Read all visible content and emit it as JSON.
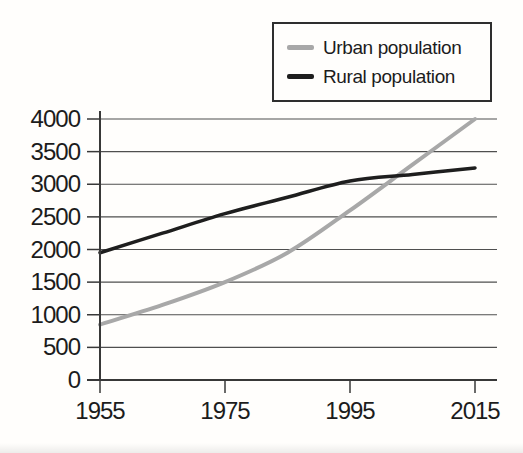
{
  "chart_data": {
    "type": "line",
    "title": "",
    "xlabel": "",
    "ylabel": "",
    "x": [
      1955,
      1965,
      1975,
      1985,
      1995,
      2005,
      2015
    ],
    "xlim": [
      1955,
      2015
    ],
    "x_ticks": [
      1955,
      1975,
      1995,
      2015
    ],
    "x_tick_labels": [
      "1955",
      "1975",
      "1995",
      "2015"
    ],
    "ylim": [
      0,
      4000
    ],
    "y_ticks": [
      0,
      500,
      1000,
      1500,
      2000,
      2500,
      3000,
      3500,
      4000
    ],
    "y_tick_labels": [
      "0",
      "500",
      "1000",
      "1500",
      "2000",
      "2500",
      "3000",
      "3500",
      "4000"
    ],
    "grid": true,
    "legend_position": "top-right",
    "series": [
      {
        "name": "Urban population",
        "color": "#a8a8a8",
        "values": [
          850,
          1150,
          1500,
          1950,
          2600,
          3300,
          4000
        ]
      },
      {
        "name": "Rural population",
        "color": "#1e1e1e",
        "values": [
          1950,
          2250,
          2550,
          2800,
          3050,
          3150,
          3250
        ]
      }
    ]
  },
  "colors": {
    "background": "#fffefc",
    "grid": "#4f4f4f",
    "axis": "#383838",
    "text": "#1c1c1c",
    "legend_border": "#2e2e2e"
  }
}
